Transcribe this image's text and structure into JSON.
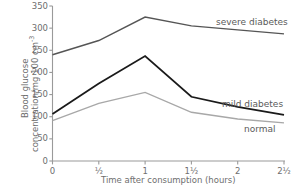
{
  "chart_data": {
    "type": "line",
    "title": "",
    "subtitle": "",
    "xlabel": "Time after consumption (hours)",
    "ylabel_line1": "Blood glucose",
    "ylabel_line2_pre": "concentration/mg 100 cm",
    "ylabel_line2_sup": "-3",
    "x": [
      0,
      0.5,
      1,
      1.5,
      2,
      2.5
    ],
    "xtick_labels": [
      "0",
      "½",
      "1",
      "1½",
      "2",
      "2½"
    ],
    "ytick_labels": [
      "0",
      "50",
      "100",
      "150",
      "200",
      "250",
      "300",
      "350"
    ],
    "ytick_values": [
      0,
      50,
      100,
      150,
      200,
      250,
      300,
      350
    ],
    "xlim": [
      0,
      2.5
    ],
    "ylim": [
      0,
      350
    ],
    "grid": false,
    "legend_position": "inline-right-of-curve",
    "series": [
      {
        "name": "severe diabetes",
        "label": "severe diabetes",
        "color": "#555555",
        "width": 1.4,
        "values": [
          240,
          272,
          325,
          305,
          296,
          287
        ]
      },
      {
        "name": "mild diabetes",
        "label": "mild diabetes",
        "color": "#1a1a1a",
        "width": 1.8,
        "values": [
          106,
          175,
          237,
          145,
          122,
          104
        ]
      },
      {
        "name": "normal",
        "label": "normal",
        "color": "#a8a8a8",
        "width": 1.4,
        "values": [
          91,
          130,
          155,
          110,
          95,
          86
        ]
      }
    ],
    "annotations": [
      {
        "text": "severe diabetes",
        "anchor_x": 2.5,
        "anchor_y": 296
      },
      {
        "text": "mild diabetes",
        "anchor_x": 2.5,
        "anchor_y": 122
      },
      {
        "text": "normal",
        "anchor_x": 2.5,
        "anchor_y": 86
      }
    ],
    "axis_color": "#9a9a9a",
    "text_color": "#6e6e6e"
  }
}
